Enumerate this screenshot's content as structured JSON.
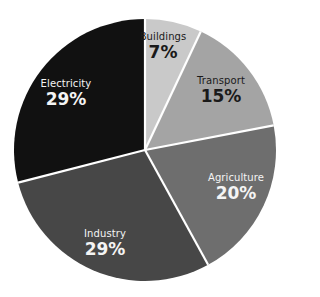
{
  "chart_data": {
    "type": "pie",
    "title": "",
    "start_angle": "top (12 o'clock)",
    "direction": "clockwise",
    "categories": [
      "Buildings",
      "Transport",
      "Agriculture",
      "Industry",
      "Electricity"
    ],
    "values": [
      7,
      15,
      20,
      29,
      29
    ],
    "unit": "%",
    "colors": [
      "#c9c9c9",
      "#a4a4a4",
      "#6e6e6e",
      "#474747",
      "#111111"
    ],
    "label_colors": [
      "#1a1a1a",
      "#1a1a1a",
      "#f4f4f4",
      "#f4f4f4",
      "#f4f4f4"
    ],
    "separator_color": "#ffffff",
    "legend": "none (labels inside slices)"
  },
  "labels": [
    {
      "name": "Buildings",
      "value": "7%"
    },
    {
      "name": "Transport",
      "value": "15%"
    },
    {
      "name": "Agriculture",
      "value": "20%"
    },
    {
      "name": "Industry",
      "value": "29%"
    },
    {
      "name": "Electricity",
      "value": "29%"
    }
  ]
}
